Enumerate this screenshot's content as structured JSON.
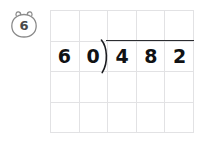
{
  "page": {
    "type": "long-division-worksheet-problem",
    "background_color": "#ffffff"
  },
  "problem": {
    "number_label": "6",
    "badge_icon": "bear-head-badge-icon",
    "badge_stroke_color": "#8a8a8a",
    "badge_text_color": "#4a4a4a"
  },
  "expression": {
    "divisor": "60",
    "dividend": "482",
    "division_symbol": ")",
    "spoken": "482 divided by 60",
    "ink_color": "#111214"
  },
  "cells": [
    {
      "value": "6",
      "role": "divisor-tens"
    },
    {
      "value": "0",
      "role": "divisor-ones"
    },
    {
      "value": "4",
      "role": "dividend-hundreds"
    },
    {
      "value": "8",
      "role": "dividend-tens"
    },
    {
      "value": "2",
      "role": "dividend-ones"
    }
  ],
  "grid": {
    "columns": 5,
    "rows": 4,
    "line_color": "#e2e2e4",
    "answer_rows_blank": 3
  }
}
